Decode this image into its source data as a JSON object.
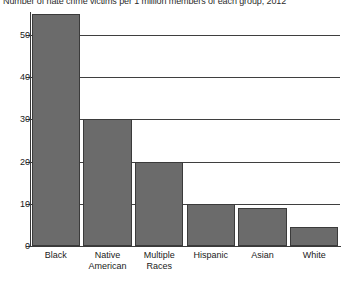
{
  "chart_data": {
    "type": "bar",
    "title": "Number of hate crime victims per 1 million members of each group, 2012",
    "xlabel": "",
    "ylabel": "",
    "categories": [
      "Black",
      "Native American",
      "Multiple Races",
      "Hispanic",
      "Asian",
      "White"
    ],
    "values": [
      55,
      30,
      20,
      10,
      9,
      4.5
    ],
    "ylim": [
      0,
      55
    ],
    "yticks": [
      0,
      10,
      20,
      30,
      40,
      50
    ],
    "ytick_labels": [
      "0",
      "10",
      "20",
      "30",
      "40",
      "50"
    ],
    "grid": true,
    "legend": false,
    "bar_color": "#6b6b6b",
    "bar_border_color": "#3b3b3b",
    "axis_color": "#3a3a3a",
    "background": "#ffffff"
  },
  "axis": {
    "ticks": [
      {
        "label": "50",
        "value": 50
      },
      {
        "label": "40",
        "value": 40
      },
      {
        "label": "30",
        "value": 30
      },
      {
        "label": "20",
        "value": 20
      },
      {
        "label": "10",
        "value": 10
      },
      {
        "label": "0",
        "value": 0
      }
    ]
  },
  "bars": [
    {
      "label": "Black",
      "label_line1": "Black",
      "label_line2": "",
      "value": 55
    },
    {
      "label": "Native American",
      "label_line1": "Native",
      "label_line2": "American",
      "value": 30
    },
    {
      "label": "Multiple Races",
      "label_line1": "Multiple",
      "label_line2": "Races",
      "value": 20
    },
    {
      "label": "Hispanic",
      "label_line1": "Hispanic",
      "label_line2": "",
      "value": 10
    },
    {
      "label": "Asian",
      "label_line1": "Asian",
      "label_line2": "",
      "value": 9
    },
    {
      "label": "White",
      "label_line1": "White",
      "label_line2": "",
      "value": 4.5
    }
  ]
}
